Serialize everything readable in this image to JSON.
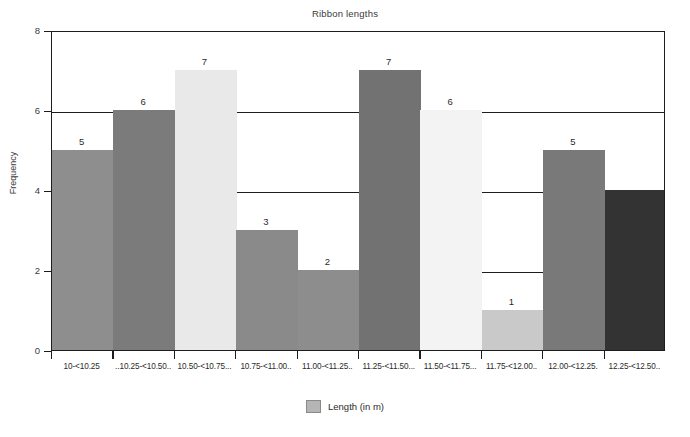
{
  "chart_data": {
    "type": "bar",
    "title": "Ribbon lengths",
    "xlabel": "",
    "ylabel": "Frequency",
    "ylim": [
      0,
      8
    ],
    "yticks": [
      0,
      2,
      4,
      6,
      8
    ],
    "grid": true,
    "legend_position": "bottom",
    "legend": [
      "Length (in m)"
    ],
    "categories": [
      "10-<10.25",
      "10.25-<10.50",
      "10.50-<10.75",
      "10.75-<11.00",
      "11.00-<11.25",
      "11.25-<11.50",
      "11.50-<11.75",
      "11.75-<12.00",
      "12.00-<12.25",
      "12.25-<12.50"
    ],
    "values": [
      5,
      6,
      7,
      3,
      2,
      7,
      6,
      1,
      5,
      4
    ],
    "bar_labels": [
      "5",
      "6",
      "7",
      "3",
      "2",
      "7",
      "6",
      "1",
      "5",
      ""
    ],
    "bar_colors": [
      "#8e8e8e",
      "#7b7b7b",
      "#e9e9e9",
      "#8a8a8a",
      "#8d8d8d",
      "#727272",
      "#f3f3f3",
      "#c9c9c9",
      "#797979",
      "#333333"
    ]
  },
  "axis": {
    "ytick_labels": [
      "8",
      "6",
      "4",
      "2",
      "0"
    ],
    "xtick_labels": [
      "10-<10.25",
      "..10.25-<10.50..",
      "10.50-<10.75...",
      "10.75-<11.00..",
      "11.00-<11.25..",
      "11.25-<11.50...",
      "11.50-<11.75...",
      "11.75-<12.00..",
      "12.00-<12.25.",
      "12.25-<12.50.."
    ]
  },
  "legend": {
    "label": "Length (in m)",
    "swatch_color": "#b5b5b5"
  }
}
